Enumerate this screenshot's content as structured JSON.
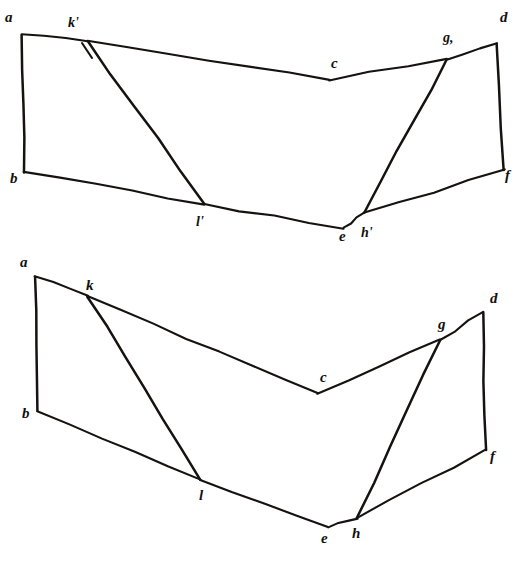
{
  "plate": {
    "title": "Two hand-drawn polygonal development diagrams",
    "background_color": "#ffffff",
    "ink_color": "#15120f",
    "figure_count": 2
  },
  "figures": [
    {
      "id": "upper-figure",
      "name": "upper-polygon-diagram",
      "labels": {
        "a": "a",
        "k_prime": "k'",
        "c": "c",
        "g_prime": "g,",
        "d": "d",
        "b": "b",
        "l_prime": "l'",
        "e": "e",
        "h_prime": "h'",
        "f": "f"
      },
      "label_order": [
        "a",
        "k'",
        "c",
        "g,",
        "d",
        "b",
        "l'",
        "e",
        "h'",
        "f"
      ],
      "vertices": {
        "a": [
          22,
          35
        ],
        "k": [
          88,
          41
        ],
        "c": [
          330,
          80
        ],
        "g": [
          447,
          59
        ],
        "d": [
          497,
          43
        ],
        "b": [
          24,
          172
        ],
        "l": [
          204,
          204
        ],
        "e": [
          344,
          228
        ],
        "h": [
          364,
          213
        ],
        "f": [
          504,
          170
        ]
      },
      "edges": [
        [
          "a",
          "k"
        ],
        [
          "k",
          "c"
        ],
        [
          "c",
          "g"
        ],
        [
          "g",
          "d"
        ],
        [
          "d",
          "f"
        ],
        [
          "f",
          "h"
        ],
        [
          "h",
          "e"
        ],
        [
          "e",
          "l"
        ],
        [
          "l",
          "b"
        ],
        [
          "b",
          "a"
        ],
        [
          "k",
          "l"
        ],
        [
          "g",
          "h"
        ]
      ]
    },
    {
      "id": "lower-figure",
      "name": "lower-polygon-diagram",
      "labels": {
        "a": "a",
        "k": "k",
        "c": "c",
        "g": "g",
        "d": "d",
        "b": "b",
        "l": "l",
        "e": "e",
        "h": "h",
        "f": "f"
      },
      "label_order": [
        "a",
        "k",
        "c",
        "g",
        "d",
        "b",
        "l",
        "e",
        "h",
        "f"
      ],
      "vertices": {
        "a": [
          35,
          277
        ],
        "k": [
          88,
          296
        ],
        "c": [
          318,
          393
        ],
        "g": [
          440,
          340
        ],
        "d": [
          483,
          312
        ],
        "b": [
          37,
          411
        ],
        "l": [
          200,
          480
        ],
        "e": [
          328,
          527
        ],
        "h": [
          357,
          518
        ],
        "f": [
          486,
          450
        ]
      },
      "edges": [
        [
          "a",
          "k"
        ],
        [
          "k",
          "c"
        ],
        [
          "c",
          "g"
        ],
        [
          "g",
          "d"
        ],
        [
          "d",
          "f"
        ],
        [
          "f",
          "h"
        ],
        [
          "h",
          "e"
        ],
        [
          "e",
          "l"
        ],
        [
          "l",
          "b"
        ],
        [
          "b",
          "a"
        ],
        [
          "k",
          "l"
        ],
        [
          "g",
          "h"
        ]
      ]
    }
  ],
  "label_positions": {
    "upper": {
      "a": [
        5,
        22
      ],
      "k'": [
        68,
        27
      ],
      "c": [
        331,
        68
      ],
      "g,": [
        443,
        42
      ],
      "d": [
        500,
        22
      ],
      "b": [
        10,
        183
      ],
      "l'": [
        196,
        226
      ],
      "e": [
        339,
        241
      ],
      "h'": [
        361,
        237
      ],
      "f": [
        505,
        180
      ]
    },
    "lower": {
      "a": [
        20,
        267
      ],
      "k": [
        86,
        290
      ],
      "c": [
        320,
        382
      ],
      "g": [
        438,
        329
      ],
      "d": [
        490,
        303
      ],
      "b": [
        22,
        418
      ],
      "l": [
        199,
        500
      ],
      "e": [
        321,
        543
      ],
      "h": [
        352,
        538
      ],
      "f": [
        490,
        461
      ]
    }
  }
}
